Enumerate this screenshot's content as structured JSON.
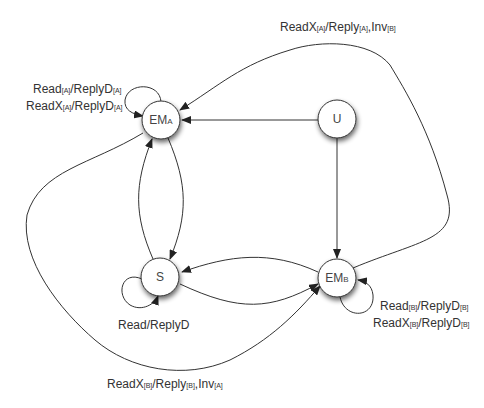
{
  "diagram": {
    "type": "state-transition",
    "nodes": [
      {
        "id": "EMA",
        "label": "EM",
        "sub": "A",
        "cx": 161,
        "cy": 180
      },
      {
        "id": "U",
        "label": "U",
        "sub": "",
        "cx": 337,
        "cy": 180
      },
      {
        "id": "S",
        "label": "S",
        "sub": "",
        "cx": 160,
        "cy": 277
      },
      {
        "id": "EMB",
        "label": "EM",
        "sub": "B",
        "cx": 337,
        "cy": 278
      }
    ],
    "edges": [
      {
        "from": "U",
        "to": "EMA",
        "label": ""
      },
      {
        "from": "U",
        "to": "EMB",
        "label": ""
      },
      {
        "from": "EMA",
        "to": "S",
        "label": ""
      },
      {
        "from": "S",
        "to": "EMA",
        "label": ""
      },
      {
        "from": "S",
        "to": "EMB",
        "label": ""
      },
      {
        "from": "EMB",
        "to": "S",
        "label": ""
      },
      {
        "from": "EMB",
        "to": "EMA",
        "label": "ReadX[A]/Reply[A],Inv[B]"
      },
      {
        "from": "EMA",
        "to": "EMB",
        "label": "ReadX[B]/Reply[B],Inv[A]"
      },
      {
        "from": "EMA",
        "to": "EMA",
        "label": "Read[A]/ReplyD[A], ReadX[A]/ReplyD[A]"
      },
      {
        "from": "S",
        "to": "S",
        "label": "Read/ReplyD"
      },
      {
        "from": "EMB",
        "to": "EMB",
        "label": "Read[B]/ReplyD[B], ReadX[B]/ReplyD[B]"
      }
    ],
    "labels": {
      "top_edge": {
        "main1": "ReadX",
        "sub1": "[A]",
        "main2": "/Reply",
        "sub2": "[A]",
        "main3": ",Inv",
        "sub3": "[B]"
      },
      "bottom_edge": {
        "main1": "ReadX",
        "sub1": "[B]",
        "main2": "/Reply",
        "sub2": "[B]",
        "main3": ",Inv",
        "sub3": "[A]"
      },
      "ema_loop_1": {
        "main1": "Read",
        "sub1": "[A]",
        "main2": "/ReplyD",
        "sub2": "[A]"
      },
      "ema_loop_2": {
        "main1": "ReadX",
        "sub1": "[A]",
        "main2": "/ReplyD",
        "sub2": "[A]"
      },
      "s_loop": "Read/ReplyD",
      "emb_loop_1": {
        "main1": "Read",
        "sub1": "[B]",
        "main2": "/ReplyD",
        "sub2": "[B]"
      },
      "emb_loop_2": {
        "main1": "ReadX",
        "sub1": "[B]",
        "main2": "/ReplyD",
        "sub2": "[B]"
      }
    },
    "node_labels": {
      "ema": {
        "main": "EM",
        "sub": "A"
      },
      "u": {
        "main": "U"
      },
      "s": {
        "main": "S"
      },
      "emb": {
        "main": "EM",
        "sub": "B"
      }
    },
    "colors": {
      "stroke": "#333333",
      "node_fill": "#ffffff",
      "text": "#333333"
    }
  }
}
